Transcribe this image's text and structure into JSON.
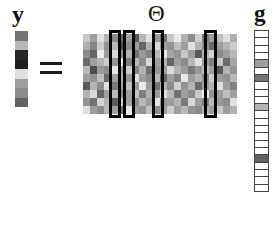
{
  "figure": {
    "caption_labels": {
      "y_label": "y",
      "theta_label": "Θ",
      "g_label": "g",
      "equals_label": "="
    },
    "equation": "y = Θ g",
    "colors": {
      "background": "#ffffff",
      "highlight_border": "#000000",
      "grid_line": "#444444",
      "text": "#111111"
    }
  },
  "chart_data": {
    "type": "heatmap",
    "xlabel": "",
    "ylabel": "",
    "grid": false,
    "legend": "none",
    "panels": [
      {
        "name": "y",
        "label": "y",
        "type": "column-vector",
        "rows": 8,
        "cols": 1,
        "values": [
          [
            0.45
          ],
          [
            0.72
          ],
          [
            0.15
          ],
          [
            0.12
          ],
          [
            0.88
          ],
          [
            0.62
          ],
          [
            0.55
          ],
          [
            0.38
          ]
        ]
      },
      {
        "name": "Theta",
        "label": "Θ",
        "type": "matrix",
        "rows": 10,
        "cols": 22,
        "values": [
          [
            0.78,
            0.62,
            0.88,
            0.7,
            0.55,
            0.4,
            0.62,
            0.35,
            0.72,
            0.88,
            0.6,
            0.45,
            0.78,
            0.92,
            0.7,
            0.55,
            0.82,
            0.48,
            0.62,
            0.75,
            0.88,
            0.68
          ],
          [
            0.68,
            0.52,
            0.8,
            0.58,
            0.72,
            0.3,
            0.55,
            0.62,
            0.4,
            0.7,
            0.85,
            0.62,
            0.58,
            0.75,
            0.62,
            0.88,
            0.7,
            0.55,
            0.42,
            0.62,
            0.7,
            0.8
          ],
          [
            0.55,
            0.4,
            0.92,
            0.62,
            0.85,
            0.55,
            0.7,
            0.45,
            0.6,
            0.52,
            0.72,
            0.9,
            0.65,
            0.58,
            0.78,
            0.62,
            0.35,
            0.7,
            0.82,
            0.55,
            0.62,
            0.72
          ],
          [
            0.42,
            0.62,
            0.7,
            0.8,
            0.58,
            0.92,
            0.48,
            0.72,
            0.55,
            0.85,
            0.62,
            0.7,
            0.4,
            0.62,
            0.55,
            0.72,
            0.88,
            0.62,
            0.5,
            0.78,
            0.42,
            0.65
          ],
          [
            0.72,
            0.3,
            0.6,
            0.55,
            0.9,
            0.62,
            0.8,
            0.52,
            0.7,
            0.45,
            0.58,
            0.62,
            0.85,
            0.7,
            0.62,
            0.48,
            0.6,
            0.75,
            0.62,
            0.35,
            0.7,
            0.58
          ],
          [
            0.62,
            0.58,
            0.75,
            0.42,
            0.62,
            0.7,
            0.58,
            0.88,
            0.62,
            0.55,
            0.72,
            0.4,
            0.62,
            0.52,
            0.9,
            0.62,
            0.7,
            0.55,
            0.8,
            0.62,
            0.58,
            0.72
          ],
          [
            0.35,
            0.7,
            0.55,
            0.88,
            0.48,
            0.62,
            0.75,
            0.6,
            0.92,
            0.62,
            0.45,
            0.7,
            0.55,
            0.82,
            0.58,
            0.7,
            0.42,
            0.62,
            0.7,
            0.88,
            0.62,
            0.5
          ],
          [
            0.7,
            0.85,
            0.4,
            0.62,
            0.72,
            0.55,
            0.62,
            0.78,
            0.5,
            0.7,
            0.62,
            0.88,
            0.72,
            0.45,
            0.62,
            0.55,
            0.78,
            0.92,
            0.58,
            0.62,
            0.75,
            0.62
          ],
          [
            0.58,
            0.45,
            0.82,
            0.7,
            0.35,
            0.8,
            0.62,
            0.55,
            0.72,
            0.62,
            0.9,
            0.58,
            0.62,
            0.7,
            0.48,
            0.85,
            0.62,
            0.52,
            0.72,
            0.6,
            0.55,
            0.88
          ],
          [
            0.88,
            0.62,
            0.55,
            0.72,
            0.62,
            0.45,
            0.9,
            0.62,
            0.58,
            0.75,
            0.55,
            0.62,
            0.8,
            0.62,
            0.72,
            0.58,
            0.55,
            0.7,
            0.62,
            0.78,
            0.62,
            0.7
          ]
        ],
        "highlighted_columns": [
          4,
          6,
          10,
          17
        ],
        "highlight_boxes": [
          {
            "left_px": 109,
            "width_px": 12
          },
          {
            "left_px": 123,
            "width_px": 12
          },
          {
            "left_px": 152,
            "width_px": 12
          },
          {
            "left_px": 204,
            "width_px": 13
          }
        ]
      },
      {
        "name": "g",
        "label": "g",
        "type": "column-vector",
        "rows": 22,
        "cols": 1,
        "sparse": true,
        "values": [
          [
            1.0
          ],
          [
            1.0
          ],
          [
            1.0
          ],
          [
            1.0
          ],
          [
            0.62
          ],
          [
            1.0
          ],
          [
            0.45
          ],
          [
            1.0
          ],
          [
            1.0
          ],
          [
            1.0
          ],
          [
            0.7
          ],
          [
            1.0
          ],
          [
            1.0
          ],
          [
            1.0
          ],
          [
            1.0
          ],
          [
            1.0
          ],
          [
            1.0
          ],
          [
            0.38
          ],
          [
            1.0
          ],
          [
            1.0
          ],
          [
            1.0
          ],
          [
            1.0
          ]
        ]
      }
    ]
  }
}
